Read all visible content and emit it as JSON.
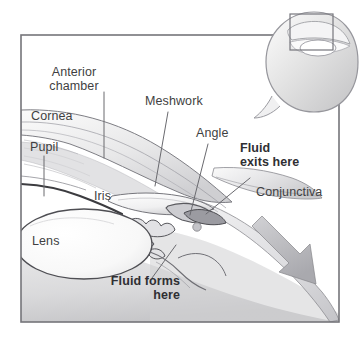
{
  "figure": {
    "kind": "anatomical-illustration",
    "style": "grayscale pen-and-wash medical drawing",
    "frame_color": "#75757a",
    "background_color": "#ffffff",
    "text_color": "#3f3f42",
    "bold_text_color": "#2f2f33",
    "leader_line_color": "#6a6a6f"
  },
  "labels": [
    {
      "id": "anterior-chamber",
      "text": "Anterior\nchamber",
      "bold": false,
      "x": 74,
      "y": 66,
      "align": "center"
    },
    {
      "id": "cornea",
      "text": "Cornea",
      "bold": false,
      "x": 31,
      "y": 110,
      "align": "left"
    },
    {
      "id": "pupil",
      "text": "Pupil",
      "bold": false,
      "x": 30,
      "y": 141,
      "align": "left"
    },
    {
      "id": "meshwork",
      "text": "Meshwork",
      "bold": false,
      "x": 145,
      "y": 95,
      "align": "left"
    },
    {
      "id": "angle",
      "text": "Angle",
      "bold": false,
      "x": 196,
      "y": 127,
      "align": "left"
    },
    {
      "id": "fluid-exits-here",
      "text": "Fluid\nexits here",
      "bold": true,
      "x": 240,
      "y": 142,
      "align": "left"
    },
    {
      "id": "conjunctiva",
      "text": "Conjunctiva",
      "bold": false,
      "x": 256,
      "y": 186,
      "align": "left"
    },
    {
      "id": "iris",
      "text": "Iris",
      "bold": false,
      "x": 94,
      "y": 190,
      "align": "left"
    },
    {
      "id": "lens",
      "text": "Lens",
      "bold": false,
      "x": 32,
      "y": 235,
      "align": "left"
    },
    {
      "id": "fluid-forms-here",
      "text": "Fluid forms\nhere",
      "bold": true,
      "x": 104,
      "y": 275,
      "align": "right"
    }
  ],
  "inset": {
    "id": "whole-eye-inset",
    "description": "Small whole-eye globe at upper right with a rectangle marking the magnified region",
    "highlight_rect": {
      "x": 290,
      "y": 14,
      "width": 43,
      "height": 36
    }
  },
  "flow_arrow": {
    "id": "aqueous-outflow-arrow",
    "description": "Gray arrow along the sclera indicating fluid draining away"
  }
}
